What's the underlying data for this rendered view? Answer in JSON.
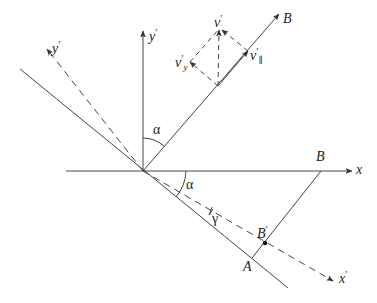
{
  "figure": {
    "type": "geometry-diagram",
    "colors": {
      "line": "#444444",
      "text": "#222222",
      "background": "#ffffff"
    }
  },
  "labels": {
    "x": "x",
    "x_prime": "x",
    "y_prime_axis": "y",
    "y_prime_dashed": "y",
    "B_field": "B",
    "B_point": "B",
    "B_prime_point": "B",
    "A_point": "A",
    "alpha_upper": "α",
    "alpha_lower": "α",
    "gamma": "γ",
    "v_prime": "v",
    "v_y_prime": "v",
    "v_y_sub": "y",
    "v_par_prime": "v",
    "v_par_sub": "∥",
    "prime": "′"
  }
}
